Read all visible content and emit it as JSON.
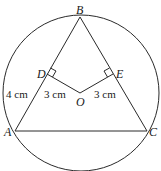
{
  "diagram": {
    "points": {
      "A": {
        "label": "A"
      },
      "B": {
        "label": "B"
      },
      "C": {
        "label": "C"
      },
      "D": {
        "label": "D"
      },
      "E": {
        "label": "E"
      },
      "O": {
        "label": "O"
      }
    },
    "measurements": {
      "AD": "4 cm",
      "OD": "3 cm",
      "OE": "3 cm"
    },
    "elements": [
      "circle with center O",
      "triangle ABC inscribed",
      "OD perpendicular to AB",
      "OE perpendicular to BC",
      "right angle marks at D and E"
    ]
  }
}
